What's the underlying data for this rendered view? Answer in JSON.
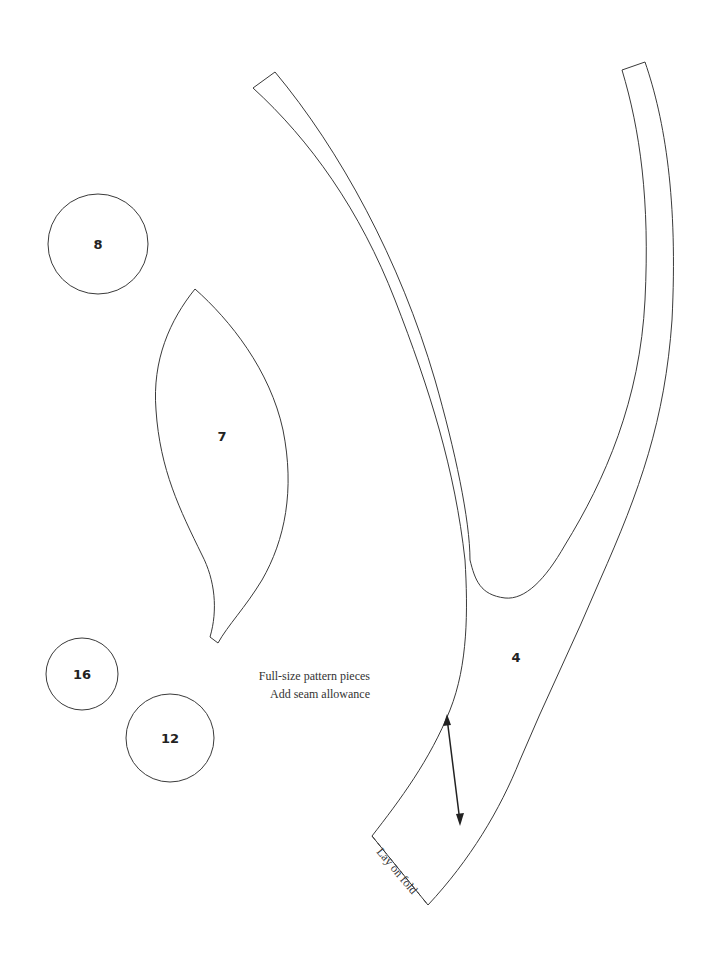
{
  "page": {
    "title": "Full-size pattern pieces",
    "note": "Add seam allowance"
  },
  "pieces": [
    {
      "id": "piece-8",
      "label": "8",
      "shape": "circle"
    },
    {
      "id": "piece-7",
      "label": "7",
      "shape": "leaf"
    },
    {
      "id": "piece-16",
      "label": "16",
      "shape": "circle"
    },
    {
      "id": "piece-12",
      "label": "12",
      "shape": "circle"
    },
    {
      "id": "piece-4",
      "label": "4",
      "shape": "forked-stem"
    }
  ],
  "markings": {
    "fold_label": "Lay on fold",
    "grainline": "grainline-arrow"
  },
  "colors": {
    "line": "#3a3a3a",
    "background": "#ffffff"
  }
}
